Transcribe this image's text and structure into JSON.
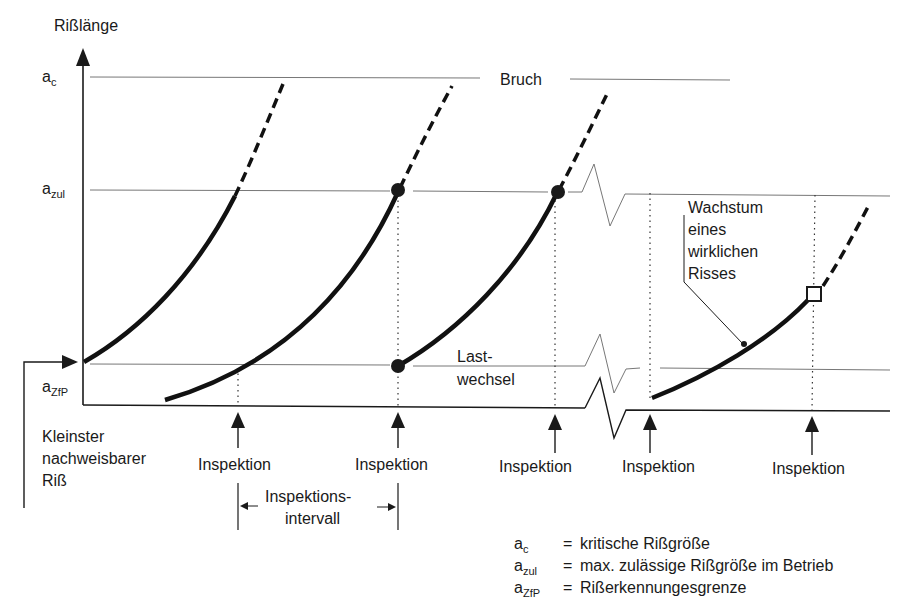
{
  "diagram": {
    "y_axis_label": "Rißlänge",
    "levels": [
      {
        "symbol": "a",
        "subscript": "c",
        "name": "a_c"
      },
      {
        "symbol": "a",
        "subscript": "zul",
        "name": "a_zul"
      },
      {
        "symbol": "a",
        "subscript": "ZfP",
        "name": "a_ZfP"
      }
    ],
    "fracture_label": "Bruch",
    "load_cycles_label_1": "Last-",
    "load_cycles_label_2": "wechsel",
    "smallest_crack_label_1": "Kleinster",
    "smallest_crack_label_2": "nachweisbarer",
    "smallest_crack_label_3": "Riß",
    "real_crack_label_1": "Wachstum",
    "real_crack_label_2": "eines",
    "real_crack_label_3": "wirklichen",
    "real_crack_label_4": "Risses",
    "inspection_label": "Inspektion",
    "inspections": [
      "Inspektion",
      "Inspektion",
      "Inspektion",
      "Inspektion",
      "Inspektion"
    ],
    "interval_label_1": "Inspektions-",
    "interval_label_2": "intervall"
  },
  "legend": {
    "items": [
      {
        "symbol": "a",
        "subscript": "c",
        "eq": "=",
        "text": "kritische Rißgröße"
      },
      {
        "symbol": "a",
        "subscript": "zul",
        "eq": "=",
        "text": "max. zulässige Rißgröße im Betrieb"
      },
      {
        "symbol": "a",
        "subscript": "ZfP",
        "eq": "=",
        "text": "Rißerkennungesgrenze"
      }
    ]
  },
  "colors": {
    "ink": "#1a1a1a",
    "grid": "#6a6a6a",
    "background": "#ffffff"
  }
}
